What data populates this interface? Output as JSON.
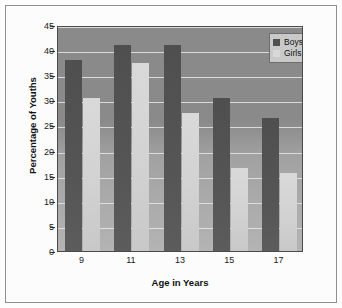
{
  "chart_data": {
    "type": "bar",
    "title": "",
    "subtitle": "",
    "xlabel": "Age in Years",
    "ylabel": "Percentage of Youths",
    "categories": [
      "9",
      "11",
      "13",
      "15",
      "17"
    ],
    "series": [
      {
        "name": "Boys",
        "color": "#4f4f4f",
        "values": [
          38,
          41,
          41,
          30.5,
          26.5
        ]
      },
      {
        "name": "Girls",
        "color": "#d9d9d9",
        "values": [
          30.5,
          37.5,
          27.5,
          16.5,
          15.5
        ]
      }
    ],
    "ylim": [
      0,
      45
    ],
    "ytick_values": [
      0,
      5,
      10,
      15,
      20,
      25,
      30,
      35,
      40,
      45
    ],
    "ytick_labels": [
      "0",
      "5",
      "10",
      "15",
      "20",
      "25",
      "30",
      "35",
      "40",
      "45"
    ],
    "grid": true,
    "grid_color": "#e8e8e8",
    "legend_position": "top-right",
    "plot_background_top_color": "#8a8a8a",
    "plot_background_bottom_color": "#b4b4b4",
    "page_background_color": "#fcfcfc",
    "border_color": "#8f8f8f"
  },
  "legend": {
    "entries": [
      {
        "label": "Boys"
      },
      {
        "label": "Girls"
      }
    ]
  }
}
